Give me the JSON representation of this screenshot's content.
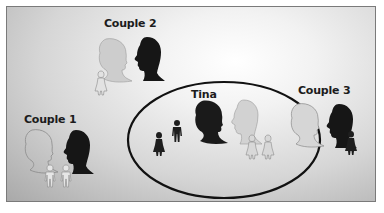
{
  "diagram": {
    "groups": [
      {
        "id": "couple1",
        "label": "Couple 1",
        "partners": [
          "woman-outline",
          "man-dark"
        ],
        "children": [
          "child-outline-boy",
          "child-outline-boy"
        ]
      },
      {
        "id": "couple2",
        "label": "Couple 2",
        "partners": [
          "woman-light",
          "man-dark"
        ],
        "children": [
          "child-outline-girl"
        ]
      },
      {
        "id": "tina",
        "label": "Tina",
        "partners": [
          "woman-dark",
          "man-light"
        ],
        "children_dark": [
          "girl-dark",
          "boy-dark"
        ],
        "children_light": [
          "girl-light",
          "girl-light"
        ],
        "enclosed_in_ellipse": true
      },
      {
        "id": "couple3",
        "label": "Couple 3",
        "partners": [
          "woman-outline",
          "man-dark"
        ],
        "children": [
          "girl-dark"
        ]
      }
    ],
    "colors": {
      "dark_silhouette": "#1a1a1a",
      "light_silhouette": "#cfcfcf",
      "outline_stroke": "#8a8a8a",
      "ellipse_stroke": "#111111",
      "panel_border": "#7a7a7a"
    }
  }
}
